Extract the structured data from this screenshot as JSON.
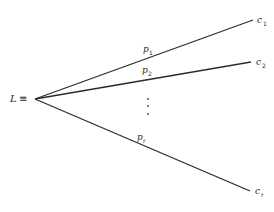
{
  "diagram": {
    "type": "lottery-tree",
    "root": {
      "symbol": "L",
      "relation": "≡"
    },
    "branches": [
      {
        "probability": {
          "base": "p",
          "sub": "1"
        },
        "outcome": {
          "base": "c",
          "sub": "1"
        }
      },
      {
        "probability": {
          "base": "p",
          "sub": "2"
        },
        "outcome": {
          "base": "c",
          "sub": "2"
        }
      },
      {
        "probability": {
          "base": "p",
          "sub": "r"
        },
        "outcome": {
          "base": "c",
          "sub": "r"
        }
      }
    ],
    "ellipsis": "⋮"
  }
}
